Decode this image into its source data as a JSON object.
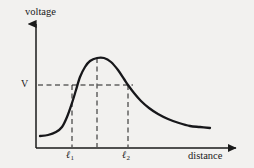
{
  "figure": {
    "background_color": "#f2f1ef",
    "ink_color": "#1a1a1a",
    "width": 254,
    "height": 168
  },
  "axes": {
    "y_axis_label": "voltage",
    "x_axis_label": "distance",
    "y_tick_label": "V",
    "x_tick_labels": [
      {
        "symbol": "ℓ",
        "subscript": "1"
      },
      {
        "symbol": "ℓ",
        "subscript": "2"
      }
    ],
    "origin_px": {
      "x": 36,
      "y": 148
    },
    "y_axis_top_px": 20,
    "x_axis_right_px": 240,
    "arrowheads": [
      "y-axis-up",
      "x-axis-right"
    ]
  },
  "guides": {
    "v_level_y_px": 85,
    "v_level_extent_x_px": 133,
    "vertical_l1_x_px": 72,
    "vertical_peak_x_px": 97,
    "vertical_l2_x_px": 128,
    "peak_y_px": 58,
    "style": "dashed"
  },
  "chart_data": {
    "type": "line",
    "title": "",
    "xlabel": "distance",
    "ylabel": "voltage",
    "grid": false,
    "legend": null,
    "annotations": [
      {
        "text": "V",
        "axis": "y",
        "value_px": 85,
        "role": "threshold-voltage-level"
      },
      {
        "text": "ℓ1",
        "axis": "x",
        "value_px": 72,
        "role": "left-crossing-of-V"
      },
      {
        "text": "ℓ2",
        "axis": "x",
        "value_px": 128,
        "role": "right-crossing-of-V"
      }
    ],
    "series": [
      {
        "name": "voltage",
        "points_px": [
          [
            40,
            136
          ],
          [
            48,
            135
          ],
          [
            56,
            132
          ],
          [
            62,
            127
          ],
          [
            67,
            117
          ],
          [
            72,
            103
          ],
          [
            76,
            90
          ],
          [
            80,
            77
          ],
          [
            85,
            67
          ],
          [
            90,
            61
          ],
          [
            97,
            58
          ],
          [
            104,
            58
          ],
          [
            111,
            62
          ],
          [
            118,
            70
          ],
          [
            124,
            79
          ],
          [
            128,
            85
          ],
          [
            134,
            93
          ],
          [
            141,
            101
          ],
          [
            149,
            108
          ],
          [
            158,
            114
          ],
          [
            168,
            119
          ],
          [
            179,
            123
          ],
          [
            190,
            126
          ],
          [
            200,
            127
          ],
          [
            210,
            128
          ]
        ]
      }
    ]
  }
}
